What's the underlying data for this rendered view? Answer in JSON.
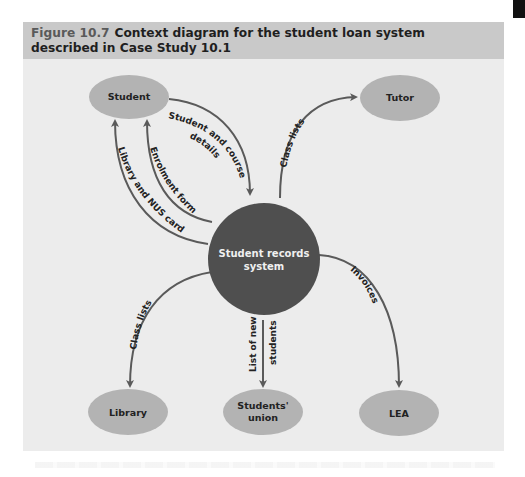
{
  "figure": {
    "number": "Figure 10.7",
    "title": "Context diagram for the student loan system described in Case Study 10.1"
  },
  "colors": {
    "frame_background": "#ececec",
    "caption_background": "#c9c9c9",
    "entity_fill": "#b3b3b3",
    "process_fill": "#4f4f4f",
    "arrow_color": "#5a5a5a"
  },
  "diagram": {
    "process": {
      "label_line1": "Student records",
      "label_line2": "system"
    },
    "entities": {
      "student": "Student",
      "tutor": "Tutor",
      "library": "Library",
      "students_union_line1": "Students'",
      "students_union_line2": "union",
      "lea": "LEA"
    },
    "flows": {
      "student_course_details_line1": "Student and course",
      "student_course_details_line2": "details",
      "class_lists_tutor": "Class lists",
      "enrolment_form": "Enrolment form",
      "library_nus_card": "Library and NUS card",
      "class_lists_library": "Class lists",
      "list_new_students_line1": "List of new",
      "list_new_students_line2": "students",
      "invoices": "Invoices"
    }
  }
}
